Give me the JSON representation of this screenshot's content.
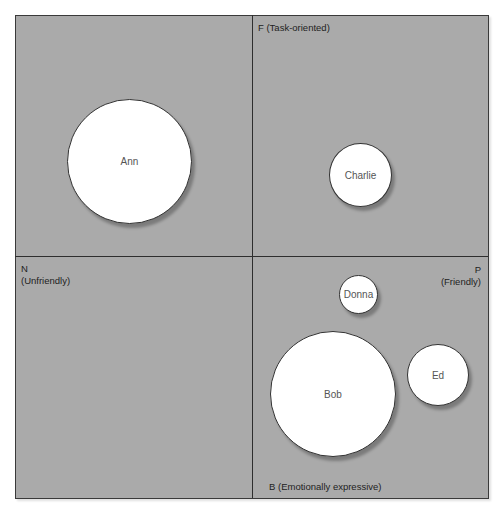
{
  "diagram": {
    "type": "quadrant-bubble-chart",
    "axes": {
      "top": {
        "letter": "F",
        "label": "F (Task-oriented)"
      },
      "bottom": {
        "letter": "B",
        "label": "B (Emotionally expressive)"
      },
      "left": {
        "letter": "N",
        "label": "(Unfriendly)"
      },
      "right": {
        "letter": "P",
        "label": "(Friendly)"
      }
    },
    "people": [
      {
        "name": "Ann",
        "quadrant": "top-left",
        "size": "large"
      },
      {
        "name": "Charlie",
        "quadrant": "top-right",
        "size": "small"
      },
      {
        "name": "Donna",
        "quadrant": "bottom-right",
        "size": "very small"
      },
      {
        "name": "Bob",
        "quadrant": "bottom-right",
        "size": "large"
      },
      {
        "name": "Ed",
        "quadrant": "bottom-right",
        "size": "small"
      }
    ],
    "colors": {
      "background": "#aaaaaa",
      "bubble_fill": "#ffffff",
      "lines": "#2e2e2e"
    }
  }
}
